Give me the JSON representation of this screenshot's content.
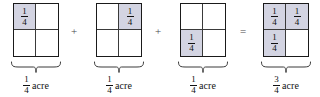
{
  "figure": {
    "shade_color": "#d3d4e2",
    "line_color": "#1a1a1a",
    "unit": "acre"
  },
  "operators": [
    {
      "symbol": "+",
      "name": "plus-operator-1"
    },
    {
      "symbol": "+",
      "name": "plus-operator-2"
    },
    {
      "symbol": "=",
      "name": "equals-operator"
    }
  ],
  "groups": [
    {
      "id": "addend-1",
      "shaded_cells": [
        0
      ],
      "cells": [
        {
          "shaded": true,
          "numerator": "1",
          "denominator": "4"
        },
        {
          "shaded": false,
          "numerator": "",
          "denominator": ""
        },
        {
          "shaded": false,
          "numerator": "",
          "denominator": ""
        },
        {
          "shaded": false,
          "numerator": "",
          "denominator": ""
        }
      ],
      "caption": {
        "numerator": "1",
        "denominator": "4",
        "unit": "acre"
      }
    },
    {
      "id": "addend-2",
      "shaded_cells": [
        1
      ],
      "cells": [
        {
          "shaded": false,
          "numerator": "",
          "denominator": ""
        },
        {
          "shaded": true,
          "numerator": "1",
          "denominator": "4"
        },
        {
          "shaded": false,
          "numerator": "",
          "denominator": ""
        },
        {
          "shaded": false,
          "numerator": "",
          "denominator": ""
        }
      ],
      "caption": {
        "numerator": "1",
        "denominator": "4",
        "unit": "acre"
      }
    },
    {
      "id": "addend-3",
      "shaded_cells": [
        2
      ],
      "cells": [
        {
          "shaded": false,
          "numerator": "",
          "denominator": ""
        },
        {
          "shaded": false,
          "numerator": "",
          "denominator": ""
        },
        {
          "shaded": true,
          "numerator": "1",
          "denominator": "4"
        },
        {
          "shaded": false,
          "numerator": "",
          "denominator": ""
        }
      ],
      "caption": {
        "numerator": "1",
        "denominator": "4",
        "unit": "acre"
      }
    },
    {
      "id": "sum",
      "shaded_cells": [
        0,
        1,
        2
      ],
      "cells": [
        {
          "shaded": true,
          "numerator": "1",
          "denominator": "4"
        },
        {
          "shaded": true,
          "numerator": "1",
          "denominator": "4"
        },
        {
          "shaded": true,
          "numerator": "1",
          "denominator": "4"
        },
        {
          "shaded": false,
          "numerator": "",
          "denominator": ""
        }
      ],
      "caption": {
        "numerator": "3",
        "denominator": "4",
        "unit": "acre"
      }
    }
  ]
}
